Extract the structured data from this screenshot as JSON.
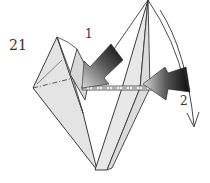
{
  "step": {
    "number": "21"
  },
  "annotations": {
    "label_1": "1",
    "label_2": "2"
  },
  "colors": {
    "paper_fill": "#e6e6e6",
    "outline": "#3a3a3a",
    "arrow_dark": "#111111",
    "arrow_light": "#d0d0d0",
    "background": "#ffffff"
  },
  "diagram": {
    "arrows": [
      {
        "id": "1",
        "type": "push-arrow",
        "direction": "left-down"
      },
      {
        "id": "2",
        "type": "push-arrow",
        "direction": "left"
      },
      {
        "id": "2-curve",
        "type": "curved-arrow",
        "direction": "down"
      }
    ]
  }
}
